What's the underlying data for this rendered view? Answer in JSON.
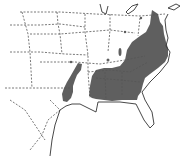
{
  "map": {
    "type": "species range map",
    "region": "Eastern United States",
    "range_color": "#5f5f5f",
    "background_color": "#ffffff",
    "border_style": "dashed state boundaries",
    "range_regions": [
      {
        "name": "main-range",
        "description": "Southeastern and mid-Atlantic states"
      },
      {
        "name": "western-range",
        "description": "Louisiana / Arkansas lobe"
      },
      {
        "name": "scattered-outliers",
        "description": "small isolated patches"
      }
    ]
  }
}
